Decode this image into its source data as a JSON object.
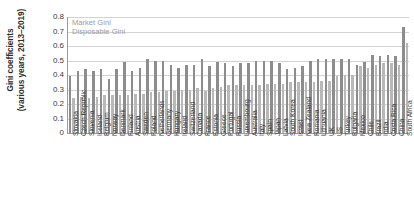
{
  "chart_data": {
    "type": "bar",
    "title": "",
    "xlabel": "",
    "ylabel": "Gini coefficients (various years, 2013–2019)",
    "ylabel_line1": "Gini coefficients",
    "ylabel_line2": "(various years, 2013–2019)",
    "ylim": [
      0,
      0.8
    ],
    "ytick_labels": [
      "0.8",
      "0.7",
      "0.6",
      "0.5",
      "0.4",
      "0.3",
      "0.2",
      "0.1",
      "0"
    ],
    "ytick_values": [
      0.8,
      0.7,
      0.6,
      0.5,
      0.4,
      0.3,
      0.2,
      0.1,
      0
    ],
    "grid": true,
    "legend_position": "top-left-inside",
    "legend": [
      "Market Gini",
      "Disposable Gini"
    ],
    "colors": {
      "market_gini": "#8d8d8d",
      "disposable_gini": "#b9b9b9",
      "gridline": "#d3d3d3",
      "axis": "#9a9a9a",
      "legend_text": "#9b9b9b",
      "tick_text": "#3a3a3a"
    },
    "categories": [
      "Slovakia",
      "Czech Republic",
      "Slovenia",
      "Iceland",
      "Belgium",
      "Norway",
      "Denmark",
      "Finland",
      "Austria",
      "Sweden",
      "Poland",
      "Netherlands",
      "Germany",
      "Hungary",
      "Ireland",
      "Switzerland",
      "Canada",
      "France",
      "Estonia",
      "Greece",
      "Portugal",
      "Russia",
      "Luxembourg",
      "Australia",
      "Italy",
      "Spain",
      "Japan",
      "Latvia",
      "South Korea",
      "Israel",
      "New Zealand",
      "Romania",
      "Lithuania",
      "UK",
      "US",
      "Turkey",
      "Bulgaria",
      "Mexico",
      "Chile",
      "Brazil",
      "India",
      "Costa Rica",
      "China",
      "South Africa"
    ],
    "series": [
      {
        "name": "Market Gini",
        "values": [
          0.39,
          0.43,
          0.44,
          0.43,
          0.44,
          0.37,
          0.44,
          0.49,
          0.43,
          0.45,
          0.51,
          0.5,
          0.5,
          0.47,
          0.45,
          0.47,
          0.47,
          0.51,
          0.46,
          0.49,
          0.48,
          0.46,
          0.48,
          0.48,
          0.5,
          0.5,
          0.5,
          0.48,
          0.44,
          0.45,
          0.46,
          0.5,
          0.51,
          0.51,
          0.51,
          0.51,
          0.51,
          0.47,
          0.49,
          0.54,
          0.53,
          0.54,
          0.53,
          0.73
        ]
      },
      {
        "name": "Disposable Gini",
        "values": [
          0.24,
          0.25,
          0.24,
          0.25,
          0.26,
          0.26,
          0.26,
          0.26,
          0.27,
          0.27,
          0.28,
          0.28,
          0.29,
          0.29,
          0.3,
          0.3,
          0.31,
          0.29,
          0.31,
          0.32,
          0.33,
          0.33,
          0.33,
          0.33,
          0.33,
          0.34,
          0.34,
          0.34,
          0.35,
          0.35,
          0.35,
          0.35,
          0.36,
          0.36,
          0.39,
          0.4,
          0.4,
          0.46,
          0.45,
          0.47,
          0.48,
          0.48,
          0.47,
          0.62
        ]
      }
    ]
  }
}
